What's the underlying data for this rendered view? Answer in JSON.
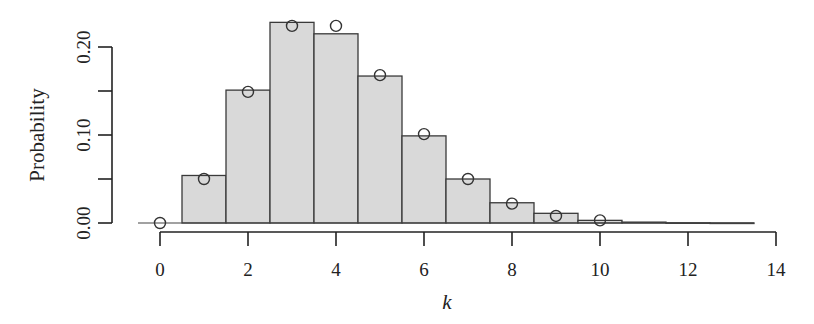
{
  "chart_data": {
    "type": "bar",
    "title": "",
    "xlabel": "k",
    "ylabel": "Probability",
    "xlim": [
      -0.5,
      14
    ],
    "ylim": [
      0.0,
      0.22
    ],
    "xticks": [
      0,
      2,
      4,
      6,
      8,
      10,
      12,
      14
    ],
    "xtick_labels": [
      "0",
      "2",
      "4",
      "6",
      "8",
      "10",
      "12",
      "14"
    ],
    "yticks": [
      0.0,
      0.05,
      0.1,
      0.15,
      0.2
    ],
    "ytick_labels": [
      "0.00",
      "",
      "0.10",
      "",
      "0.20"
    ],
    "grid": false,
    "legend": null,
    "categories": [
      0,
      1,
      2,
      3,
      4,
      5,
      6,
      7,
      8,
      9,
      10,
      11,
      12,
      13
    ],
    "series": [
      {
        "name": "Histogram (bars)",
        "style": "bar",
        "values": [
          0.0,
          0.054,
          0.151,
          0.228,
          0.215,
          0.167,
          0.099,
          0.05,
          0.023,
          0.011,
          0.003,
          0.001,
          0.0003,
          0.0001
        ]
      },
      {
        "name": "Model probabilities (open circles)",
        "style": "points",
        "x": [
          0,
          1,
          2,
          3,
          4,
          5,
          6,
          7,
          8,
          9,
          10
        ],
        "values": [
          0.0,
          0.05,
          0.149,
          0.224,
          0.224,
          0.168,
          0.101,
          0.05,
          0.022,
          0.008,
          0.003
        ]
      }
    ],
    "colors": {
      "bar_fill": "#d9d9d9",
      "bar_edge": "#3a3a3a",
      "axis": "#222222",
      "point_edge": "#333333"
    }
  }
}
